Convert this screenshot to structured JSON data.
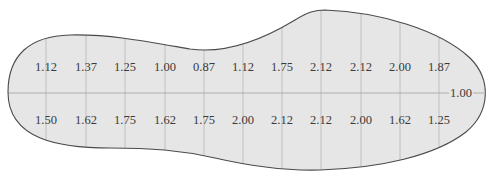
{
  "figure": {
    "colors": {
      "fill": "#e6e6e6",
      "outline": "#4a4a4a",
      "gridline": "#b5b5b5",
      "text": "#3a3a3a"
    },
    "top_row": [
      "1.12",
      "1.37",
      "1.25",
      "1.00",
      "0.87",
      "1.12",
      "1.75",
      "2.12",
      "2.12",
      "2.00",
      "1.87"
    ],
    "bottom_row": [
      "1.50",
      "1.62",
      "1.75",
      "1.62",
      "1.75",
      "2.00",
      "2.12",
      "2.12",
      "2.00",
      "1.62",
      "1.25"
    ],
    "end_label": "1.00"
  }
}
